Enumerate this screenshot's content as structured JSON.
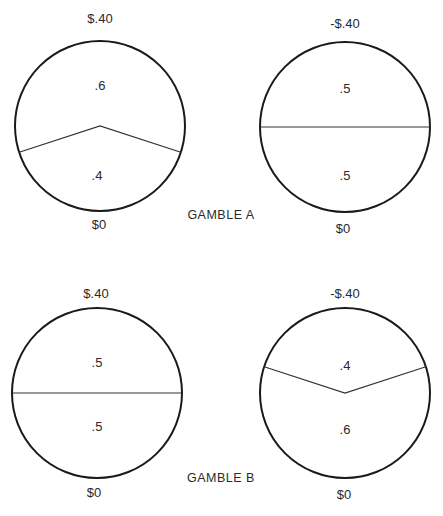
{
  "diagram": {
    "gambles": [
      {
        "label": "GAMBLE A",
        "wheels": [
          {
            "top_outcome": "$.40",
            "bottom_outcome": "$0",
            "top_prob_label": ".6",
            "bottom_prob_label": ".4",
            "top_prob": 0.6,
            "bottom_prob": 0.4,
            "small_slice": "bottom"
          },
          {
            "top_outcome": "-$.40",
            "bottom_outcome": "$0",
            "top_prob_label": ".5",
            "bottom_prob_label": ".5",
            "top_prob": 0.5,
            "bottom_prob": 0.5,
            "small_slice": "none"
          }
        ]
      },
      {
        "label": "GAMBLE B",
        "wheels": [
          {
            "top_outcome": "$.40",
            "bottom_outcome": "$0",
            "top_prob_label": ".5",
            "bottom_prob_label": ".5",
            "top_prob": 0.5,
            "bottom_prob": 0.5,
            "small_slice": "none"
          },
          {
            "top_outcome": "-$.40",
            "bottom_outcome": "$0",
            "top_prob_label": ".4",
            "bottom_prob_label": ".6",
            "top_prob": 0.4,
            "bottom_prob": 0.6,
            "small_slice": "top"
          }
        ]
      }
    ],
    "colors": {
      "stroke": "#1a1a1a",
      "text": "#2a2a2a",
      "background": "#ffffff"
    }
  }
}
